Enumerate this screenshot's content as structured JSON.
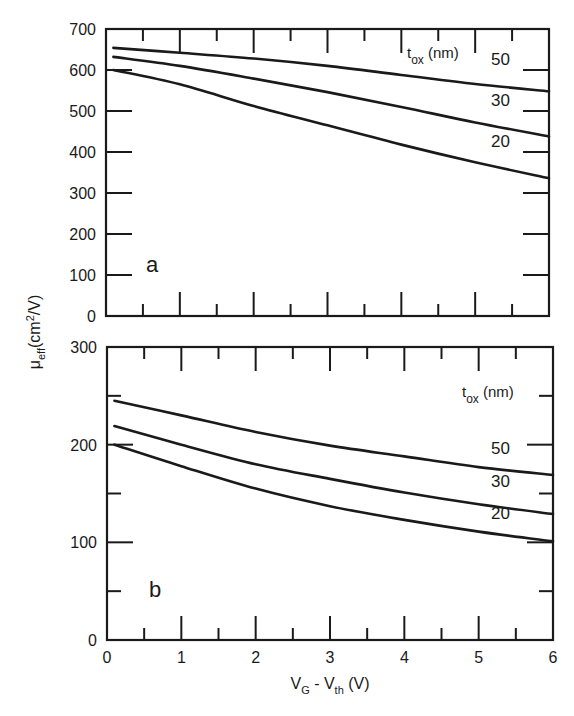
{
  "chart_data": [
    {
      "panel": "a",
      "type": "line",
      "title": "",
      "xlabel": "V_G - V_th (V)",
      "ylabel": "μ_eff (cm²/V)",
      "xlim": [
        0,
        6
      ],
      "ylim": [
        0,
        700
      ],
      "yticks": [
        0,
        100,
        200,
        300,
        400,
        500,
        600,
        700
      ],
      "legend_title": "t_ox (nm)",
      "grid": false,
      "x": [
        0.1,
        1,
        2,
        3,
        4,
        5,
        6
      ],
      "series": [
        {
          "name": "50",
          "values": [
            654,
            642,
            628,
            610,
            588,
            566,
            548
          ]
        },
        {
          "name": "30",
          "values": [
            632,
            610,
            579,
            546,
            510,
            472,
            438
          ]
        },
        {
          "name": "20",
          "values": [
            600,
            565,
            512,
            465,
            418,
            375,
            336
          ]
        }
      ]
    },
    {
      "panel": "b",
      "type": "line",
      "title": "",
      "xlabel": "V_G - V_th (V)",
      "ylabel": "μ_eff (cm²/V)",
      "xlim": [
        0,
        6
      ],
      "ylim": [
        0,
        300
      ],
      "yticks": [
        0,
        100,
        200,
        300
      ],
      "xticks": [
        0,
        1,
        2,
        3,
        4,
        5,
        6
      ],
      "legend_title": "t_ox (nm)",
      "grid": false,
      "x": [
        0.1,
        1,
        2,
        3,
        4,
        5,
        6
      ],
      "series": [
        {
          "name": "50",
          "values": [
            245,
            230,
            213,
            199,
            188,
            177,
            169
          ]
        },
        {
          "name": "30",
          "values": [
            219,
            200,
            180,
            165,
            151,
            139,
            129
          ]
        },
        {
          "name": "20",
          "values": [
            200,
            178,
            155,
            137,
            123,
            111,
            101
          ]
        }
      ]
    }
  ],
  "labels": {
    "panel_a": "a",
    "panel_b": "b",
    "legend_t": "t",
    "legend_sub": "ox",
    "legend_unit": " (nm)",
    "y_mu": "μ",
    "y_sub": "eff",
    "y_unit_open": "(cm",
    "y_unit_sup": "2",
    "y_unit_close": "/V)",
    "x_vg": "V",
    "x_vg_sub": "G",
    "x_minus": " - V",
    "x_vth_sub": "th",
    "x_unit": " (V)"
  },
  "colors": {
    "line": "#1a1a1a",
    "background": "#ffffff"
  }
}
